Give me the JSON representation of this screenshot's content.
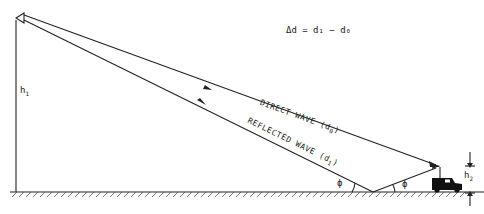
{
  "diagram": {
    "equation": "Δd = d₁ − d₀",
    "labels": {
      "h1": "h",
      "h1_sub": "1",
      "h2": "h",
      "h2_sub": "2",
      "direct_wave": "DIRECT WAVE (d",
      "direct_wave_sub": "0",
      "reflected_wave": "REFLECTED WAVE (d",
      "reflected_wave_sub": "1",
      "close_paren": ")",
      "phi_left": "ϕ",
      "phi_right": "ϕ"
    },
    "elements": [
      "transmitter-antenna",
      "direct-wave-path",
      "reflected-wave-path",
      "ground-plane",
      "vehicle-receiver"
    ],
    "colors": {
      "line": "#222222",
      "background": "#ffffff"
    }
  }
}
